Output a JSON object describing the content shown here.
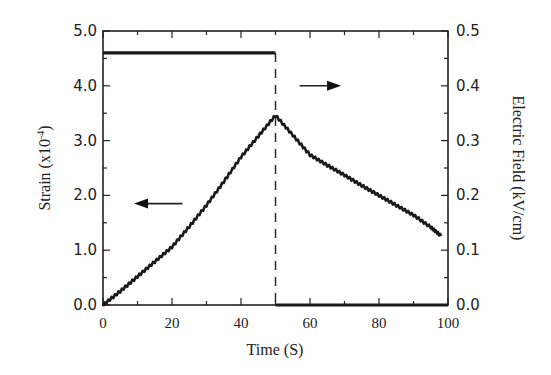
{
  "chart_data": {
    "type": "line",
    "title": "",
    "xlabel": "Time (S)",
    "ylabel": "Strain (x10⁻⁴)",
    "ylabel_right": "Electric Field (kV/cm)",
    "xlim": [
      0,
      100
    ],
    "ylim": [
      0,
      5.0
    ],
    "ylim_right": [
      0,
      0.5
    ],
    "x_ticks": [
      0,
      20,
      40,
      60,
      80,
      100
    ],
    "x_tick_labels": [
      "0",
      "20",
      "40",
      "60",
      "80",
      "100"
    ],
    "y_ticks": [
      0,
      1,
      2,
      3,
      4,
      5
    ],
    "y_tick_labels": [
      "0.0",
      "1.0",
      "2.0",
      "3.0",
      "4.0",
      "5.0"
    ],
    "y_right_ticks": [
      0,
      0.1,
      0.2,
      0.3,
      0.4,
      0.5
    ],
    "y_right_tick_labels": [
      "0.0",
      "0.1",
      "0.2",
      "0.3",
      "0.4",
      "0.5"
    ],
    "grid": false,
    "legend": null,
    "series": [
      {
        "name": "Strain",
        "axis": "left",
        "style": "noisy-thick-line",
        "x": [
          0,
          5,
          10,
          15,
          20,
          25,
          30,
          35,
          40,
          45,
          50,
          55,
          60,
          65,
          70,
          75,
          80,
          85,
          90,
          95,
          98
        ],
        "values": [
          0.0,
          0.25,
          0.52,
          0.79,
          1.06,
          1.43,
          1.82,
          2.25,
          2.7,
          3.08,
          3.46,
          3.1,
          2.74,
          2.55,
          2.37,
          2.18,
          2.0,
          1.82,
          1.64,
          1.42,
          1.26
        ]
      },
      {
        "name": "Electric Field",
        "axis": "right",
        "style": "step-line",
        "x": [
          0,
          50,
          50,
          100
        ],
        "values": [
          0.46,
          0.46,
          0.0,
          0.0
        ]
      }
    ],
    "annotations": [
      {
        "type": "vertical-dashed-line",
        "x": 50
      },
      {
        "type": "arrow",
        "direction": "left",
        "points_to_axis": "left",
        "x_from": 23,
        "x_to": 9,
        "y": 1.85
      },
      {
        "type": "arrow",
        "direction": "right",
        "points_to_axis": "right",
        "x_from": 57,
        "x_to": 69,
        "y": 4.0
      }
    ]
  }
}
